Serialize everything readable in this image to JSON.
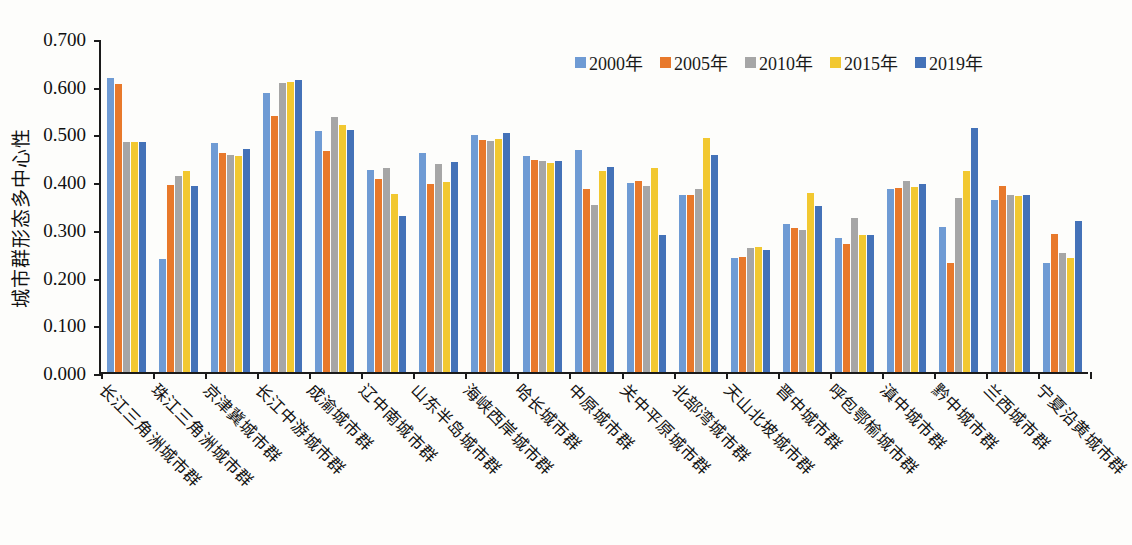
{
  "chart_data": {
    "type": "bar",
    "title": "",
    "xlabel": "",
    "ylabel": "城市群形态多中心性",
    "ylim": [
      0.0,
      0.7
    ],
    "ytick_labels": [
      "0.700",
      "0.600",
      "0.500",
      "0.400",
      "0.300",
      "0.200",
      "0.100",
      "0.000"
    ],
    "ytick_values": [
      0.7,
      0.6,
      0.5,
      0.4,
      0.3,
      0.2,
      0.1,
      0.0
    ],
    "grid": false,
    "legend_position": "top-right",
    "categories": [
      "长江三角洲城市群",
      "珠江三角洲城市群",
      "京津冀城市群",
      "长江中游城市群",
      "成渝城市群",
      "辽中南城市群",
      "山东半岛城市群",
      "海峡西岸城市群",
      "哈长城市群",
      "中原城市群",
      "关中平原城市群",
      "北部湾城市群",
      "天山北坡城市群",
      "晋中城市群",
      "呼包鄂榆城市群",
      "滇中城市群",
      "黔中城市群",
      "兰西城市群",
      "宁夏沿黄城市群"
    ],
    "series": [
      {
        "name": "2000年",
        "color": "#6F9BD4",
        "values": [
          0.617,
          0.237,
          0.48,
          0.585,
          0.505,
          0.423,
          0.46,
          0.496,
          0.452,
          0.465,
          0.397,
          0.372,
          0.238,
          0.311,
          0.28,
          0.383,
          0.303,
          0.36,
          0.228
        ]
      },
      {
        "name": "2005年",
        "color": "#E8792B",
        "values": [
          0.604,
          0.392,
          0.46,
          0.537,
          0.463,
          0.405,
          0.395,
          0.487,
          0.445,
          0.383,
          0.4,
          0.37,
          0.242,
          0.302,
          0.268,
          0.385,
          0.228,
          0.39,
          0.29
        ]
      },
      {
        "name": "2010年",
        "color": "#A6A6A6",
        "values": [
          0.482,
          0.411,
          0.455,
          0.605,
          0.535,
          0.428,
          0.435,
          0.485,
          0.442,
          0.351,
          0.39,
          0.384,
          0.26,
          0.298,
          0.322,
          0.4,
          0.365,
          0.37,
          0.25
        ]
      },
      {
        "name": "2015年",
        "color": "#F2C830",
        "values": [
          0.482,
          0.422,
          0.452,
          0.608,
          0.517,
          0.374,
          0.398,
          0.488,
          0.438,
          0.422,
          0.428,
          0.49,
          0.262,
          0.375,
          0.288,
          0.388,
          0.422,
          0.369,
          0.238
        ]
      },
      {
        "name": "2019年",
        "color": "#4472B8",
        "values": [
          0.483,
          0.39,
          0.468,
          0.612,
          0.508,
          0.327,
          0.441,
          0.5,
          0.442,
          0.43,
          0.288,
          0.454,
          0.255,
          0.348,
          0.288,
          0.395,
          0.512,
          0.372,
          0.317
        ]
      }
    ]
  }
}
